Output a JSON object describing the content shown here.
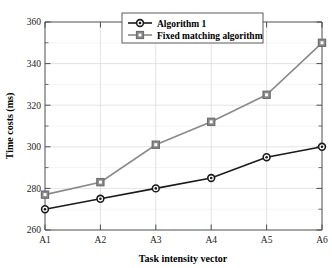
{
  "chart_data": {
    "type": "line",
    "title": "",
    "xlabel": "Task intensity vector",
    "ylabel": "Time costs (ms)",
    "categories": [
      "A1",
      "A2",
      "A3",
      "A4",
      "A5",
      "A6"
    ],
    "series": [
      {
        "name": "Algorithm 1",
        "marker": "circle",
        "color": "#1a1a1a",
        "values": [
          270,
          275,
          280,
          285,
          295,
          300
        ]
      },
      {
        "name": "Fixed matching algorithm",
        "marker": "square",
        "color": "#8a8a8a",
        "values": [
          277,
          283,
          301,
          312,
          325,
          350
        ]
      }
    ],
    "ylim": [
      260,
      360
    ],
    "yticks": [
      260,
      280,
      300,
      320,
      340,
      360
    ],
    "yticklabels": [
      "260",
      "280",
      "300",
      "320",
      "340",
      "360"
    ],
    "yminorticks": [
      270,
      290,
      310,
      330,
      350
    ],
    "xticklabels": [
      "A1",
      "A2",
      "A3",
      "A4",
      "A5",
      "A6"
    ],
    "grid": true,
    "legend_position": "top-center",
    "axis_color": "#4d4d4d",
    "grid_color": "#d8d8d8",
    "background": "#ffffff"
  },
  "legend": {
    "entries": [
      {
        "label": "Algorithm 1"
      },
      {
        "label": "Fixed matching algorithm"
      }
    ]
  }
}
